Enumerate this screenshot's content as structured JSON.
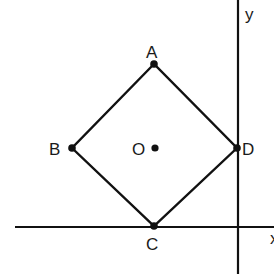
{
  "diagram": {
    "axes": {
      "x_label": "x",
      "y_label": "y",
      "y_axis_x": 238,
      "x_axis_y": 227
    },
    "points": [
      {
        "id": "A",
        "label": "A",
        "x": 154,
        "y": 64
      },
      {
        "id": "B",
        "label": "B",
        "x": 72,
        "y": 148
      },
      {
        "id": "C",
        "label": "C",
        "x": 154,
        "y": 226
      },
      {
        "id": "D",
        "label": "D",
        "x": 237,
        "y": 148
      },
      {
        "id": "O",
        "label": "O",
        "x": 155,
        "y": 148
      }
    ],
    "stroke_color": "#111111"
  }
}
